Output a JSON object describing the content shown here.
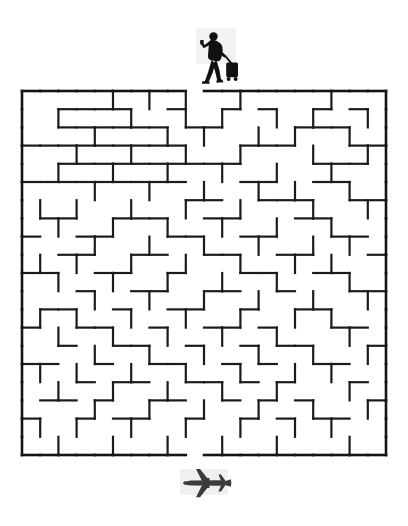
{
  "page": {
    "title": "Travel Maze Puzzle",
    "background_color": "#ffffff",
    "width": 408,
    "height": 526
  },
  "icons": {
    "start": {
      "name": "traveler-with-luggage-icon",
      "label": "Traveler pulling rolling suitcase",
      "color": "#111111",
      "x": 190,
      "y": 28,
      "width": 52,
      "height": 60
    },
    "finish": {
      "name": "airplane-icon",
      "label": "Airplane",
      "color": "#3b3b3b",
      "x": 178,
      "y": 466,
      "width": 58,
      "height": 34
    }
  },
  "maze": {
    "name": "travel-maze",
    "cols": 20,
    "rows": 20,
    "cell_size": 18.2,
    "origin_x": 2,
    "origin_y": 3,
    "wall_color": "#1b1b1b",
    "wall_width": 2.2,
    "border_color": "#141414",
    "border_width": 2.6,
    "entrance": {
      "side": "top",
      "col": 9
    },
    "exit": {
      "side": "bottom",
      "col": 9
    },
    "h_walls": [
      [
        1,
        0,
        1
      ],
      [
        2,
        0,
        1
      ],
      [
        3,
        0,
        1
      ],
      [
        4,
        0,
        1
      ],
      [
        5,
        0,
        1
      ],
      [
        6,
        0,
        1
      ],
      [
        7,
        0,
        1
      ],
      [
        8,
        0,
        1
      ],
      [
        10,
        0,
        1
      ],
      [
        11,
        0,
        1
      ],
      [
        12,
        0,
        1
      ],
      [
        13,
        0,
        1
      ],
      [
        14,
        0,
        1
      ],
      [
        15,
        0,
        1
      ],
      [
        16,
        0,
        1
      ],
      [
        17,
        0,
        1
      ],
      [
        18,
        0,
        1
      ],
      [
        19,
        0,
        1
      ],
      [
        0,
        0,
        1
      ],
      [
        2,
        1,
        1
      ],
      [
        3,
        1,
        1
      ],
      [
        4,
        1,
        1
      ],
      [
        5,
        1,
        1
      ],
      [
        8,
        1,
        1
      ],
      [
        11,
        1,
        1
      ],
      [
        13,
        1,
        1
      ],
      [
        16,
        1,
        1
      ],
      [
        18,
        1,
        1
      ],
      [
        2,
        2,
        1
      ],
      [
        3,
        2,
        1
      ],
      [
        4,
        2,
        1
      ],
      [
        5,
        2,
        1
      ],
      [
        6,
        2,
        1
      ],
      [
        7,
        2,
        1
      ],
      [
        9,
        2,
        1
      ],
      [
        10,
        2,
        1
      ],
      [
        15,
        2,
        1
      ],
      [
        16,
        2,
        1
      ],
      [
        17,
        2,
        1
      ],
      [
        0,
        3,
        1
      ],
      [
        1,
        3,
        1
      ],
      [
        2,
        3,
        1
      ],
      [
        3,
        3,
        1
      ],
      [
        4,
        3,
        1
      ],
      [
        5,
        3,
        1
      ],
      [
        6,
        3,
        1
      ],
      [
        7,
        3,
        1
      ],
      [
        8,
        3,
        1
      ],
      [
        12,
        3,
        1
      ],
      [
        13,
        3,
        1
      ],
      [
        14,
        3,
        1
      ],
      [
        18,
        3,
        1
      ],
      [
        19,
        3,
        1
      ],
      [
        2,
        4,
        1
      ],
      [
        3,
        4,
        1
      ],
      [
        4,
        4,
        1
      ],
      [
        5,
        4,
        1
      ],
      [
        6,
        4,
        1
      ],
      [
        7,
        4,
        1
      ],
      [
        8,
        4,
        1
      ],
      [
        9,
        4,
        1
      ],
      [
        10,
        4,
        1
      ],
      [
        11,
        4,
        1
      ],
      [
        16,
        4,
        1
      ],
      [
        17,
        4,
        1
      ],
      [
        18,
        4,
        1
      ],
      [
        0,
        5,
        1
      ],
      [
        1,
        5,
        1
      ],
      [
        2,
        5,
        1
      ],
      [
        3,
        5,
        1
      ],
      [
        4,
        5,
        1
      ],
      [
        5,
        5,
        1
      ],
      [
        6,
        5,
        1
      ],
      [
        7,
        5,
        1
      ],
      [
        8,
        5,
        1
      ],
      [
        12,
        5,
        1
      ],
      [
        13,
        5,
        1
      ],
      [
        16,
        5,
        1
      ],
      [
        17,
        5,
        1
      ],
      [
        9,
        6,
        1
      ],
      [
        10,
        6,
        1
      ],
      [
        13,
        6,
        1
      ],
      [
        14,
        6,
        1
      ],
      [
        15,
        6,
        1
      ],
      [
        18,
        6,
        1
      ],
      [
        19,
        6,
        1
      ],
      [
        1,
        7,
        1
      ],
      [
        2,
        7,
        1
      ],
      [
        5,
        7,
        1
      ],
      [
        6,
        7,
        1
      ],
      [
        7,
        7,
        1
      ],
      [
        10,
        7,
        1
      ],
      [
        11,
        7,
        1
      ],
      [
        15,
        7,
        1
      ],
      [
        16,
        7,
        1
      ],
      [
        0,
        8,
        1
      ],
      [
        3,
        8,
        1
      ],
      [
        4,
        8,
        1
      ],
      [
        8,
        8,
        1
      ],
      [
        9,
        8,
        1
      ],
      [
        12,
        8,
        1
      ],
      [
        13,
        8,
        1
      ],
      [
        17,
        8,
        1
      ],
      [
        18,
        8,
        1
      ],
      [
        2,
        9,
        1
      ],
      [
        3,
        9,
        1
      ],
      [
        6,
        9,
        1
      ],
      [
        7,
        9,
        1
      ],
      [
        10,
        9,
        1
      ],
      [
        11,
        9,
        1
      ],
      [
        14,
        9,
        1
      ],
      [
        15,
        9,
        1
      ],
      [
        19,
        9,
        1
      ],
      [
        0,
        10,
        1
      ],
      [
        1,
        10,
        1
      ],
      [
        4,
        10,
        1
      ],
      [
        5,
        10,
        1
      ],
      [
        8,
        10,
        1
      ],
      [
        12,
        10,
        1
      ],
      [
        13,
        10,
        1
      ],
      [
        16,
        10,
        1
      ],
      [
        17,
        10,
        1
      ],
      [
        3,
        11,
        1
      ],
      [
        6,
        11,
        1
      ],
      [
        7,
        11,
        1
      ],
      [
        10,
        11,
        1
      ],
      [
        11,
        11,
        1
      ],
      [
        14,
        11,
        1
      ],
      [
        18,
        11,
        1
      ],
      [
        19,
        11,
        1
      ],
      [
        1,
        12,
        1
      ],
      [
        2,
        12,
        1
      ],
      [
        5,
        12,
        1
      ],
      [
        8,
        12,
        1
      ],
      [
        9,
        12,
        1
      ],
      [
        12,
        12,
        1
      ],
      [
        15,
        12,
        1
      ],
      [
        16,
        12,
        1
      ],
      [
        0,
        13,
        1
      ],
      [
        3,
        13,
        1
      ],
      [
        4,
        13,
        1
      ],
      [
        7,
        13,
        1
      ],
      [
        10,
        13,
        1
      ],
      [
        11,
        13,
        1
      ],
      [
        13,
        13,
        1
      ],
      [
        17,
        13,
        1
      ],
      [
        18,
        13,
        1
      ],
      [
        2,
        14,
        1
      ],
      [
        5,
        14,
        1
      ],
      [
        6,
        14,
        1
      ],
      [
        9,
        14,
        1
      ],
      [
        12,
        14,
        1
      ],
      [
        14,
        14,
        1
      ],
      [
        15,
        14,
        1
      ],
      [
        19,
        14,
        1
      ],
      [
        0,
        15,
        1
      ],
      [
        1,
        15,
        1
      ],
      [
        4,
        15,
        1
      ],
      [
        7,
        15,
        1
      ],
      [
        8,
        15,
        1
      ],
      [
        11,
        15,
        1
      ],
      [
        13,
        15,
        1
      ],
      [
        16,
        15,
        1
      ],
      [
        17,
        15,
        1
      ],
      [
        3,
        16,
        1
      ],
      [
        5,
        16,
        1
      ],
      [
        6,
        16,
        1
      ],
      [
        9,
        16,
        1
      ],
      [
        10,
        16,
        1
      ],
      [
        12,
        16,
        1
      ],
      [
        14,
        16,
        1
      ],
      [
        18,
        16,
        1
      ],
      [
        1,
        17,
        1
      ],
      [
        2,
        17,
        1
      ],
      [
        4,
        17,
        1
      ],
      [
        7,
        17,
        1
      ],
      [
        8,
        17,
        1
      ],
      [
        11,
        17,
        1
      ],
      [
        13,
        17,
        1
      ],
      [
        15,
        17,
        1
      ],
      [
        19,
        17,
        1
      ],
      [
        0,
        18,
        1
      ],
      [
        3,
        18,
        1
      ],
      [
        5,
        18,
        1
      ],
      [
        6,
        18,
        1
      ],
      [
        9,
        18,
        1
      ],
      [
        12,
        18,
        1
      ],
      [
        14,
        18,
        1
      ],
      [
        16,
        18,
        1
      ],
      [
        17,
        18,
        1
      ],
      [
        0,
        20,
        1
      ],
      [
        1,
        20,
        1
      ],
      [
        2,
        20,
        1
      ],
      [
        3,
        20,
        1
      ],
      [
        4,
        20,
        1
      ],
      [
        5,
        20,
        1
      ],
      [
        6,
        20,
        1
      ],
      [
        7,
        20,
        1
      ],
      [
        8,
        20,
        1
      ],
      [
        10,
        20,
        1
      ],
      [
        11,
        20,
        1
      ],
      [
        12,
        20,
        1
      ],
      [
        13,
        20,
        1
      ],
      [
        14,
        20,
        1
      ],
      [
        15,
        20,
        1
      ],
      [
        16,
        20,
        1
      ],
      [
        17,
        20,
        1
      ],
      [
        18,
        20,
        1
      ],
      [
        19,
        20,
        1
      ]
    ],
    "v_walls": [
      [
        0,
        0,
        1
      ],
      [
        0,
        1,
        1
      ],
      [
        0,
        2,
        1
      ],
      [
        0,
        3,
        1
      ],
      [
        0,
        4,
        1
      ],
      [
        0,
        5,
        1
      ],
      [
        0,
        6,
        1
      ],
      [
        0,
        7,
        1
      ],
      [
        0,
        8,
        1
      ],
      [
        0,
        9,
        1
      ],
      [
        0,
        10,
        1
      ],
      [
        0,
        11,
        1
      ],
      [
        0,
        12,
        1
      ],
      [
        0,
        13,
        1
      ],
      [
        0,
        14,
        1
      ],
      [
        0,
        15,
        1
      ],
      [
        0,
        16,
        1
      ],
      [
        0,
        17,
        1
      ],
      [
        0,
        18,
        1
      ],
      [
        0,
        19,
        1
      ],
      [
        20,
        0,
        1
      ],
      [
        20,
        1,
        1
      ],
      [
        20,
        2,
        1
      ],
      [
        20,
        3,
        1
      ],
      [
        20,
        4,
        1
      ],
      [
        20,
        5,
        1
      ],
      [
        20,
        6,
        1
      ],
      [
        20,
        7,
        1
      ],
      [
        20,
        8,
        1
      ],
      [
        20,
        9,
        1
      ],
      [
        20,
        10,
        1
      ],
      [
        20,
        11,
        1
      ],
      [
        20,
        12,
        1
      ],
      [
        20,
        13,
        1
      ],
      [
        20,
        14,
        1
      ],
      [
        20,
        15,
        1
      ],
      [
        20,
        16,
        1
      ],
      [
        20,
        17,
        1
      ],
      [
        20,
        18,
        1
      ],
      [
        20,
        19,
        1
      ],
      [
        5,
        0,
        1
      ],
      [
        7,
        0,
        1
      ],
      [
        9,
        0,
        1
      ],
      [
        12,
        0,
        1
      ],
      [
        17,
        0,
        1
      ],
      [
        2,
        1,
        1
      ],
      [
        6,
        1,
        1
      ],
      [
        9,
        1,
        1
      ],
      [
        11,
        1,
        1
      ],
      [
        14,
        1,
        1
      ],
      [
        16,
        1,
        1
      ],
      [
        19,
        1,
        1
      ],
      [
        4,
        2,
        1
      ],
      [
        8,
        2,
        1
      ],
      [
        10,
        2,
        1
      ],
      [
        13,
        2,
        1
      ],
      [
        15,
        2,
        1
      ],
      [
        18,
        2,
        1
      ],
      [
        3,
        3,
        1
      ],
      [
        6,
        3,
        1
      ],
      [
        9,
        3,
        1
      ],
      [
        12,
        3,
        1
      ],
      [
        16,
        3,
        1
      ],
      [
        19,
        3,
        1
      ],
      [
        2,
        4,
        1
      ],
      [
        5,
        4,
        1
      ],
      [
        8,
        4,
        1
      ],
      [
        11,
        4,
        1
      ],
      [
        14,
        4,
        1
      ],
      [
        17,
        4,
        1
      ],
      [
        4,
        5,
        1
      ],
      [
        7,
        5,
        1
      ],
      [
        10,
        5,
        1
      ],
      [
        13,
        5,
        1
      ],
      [
        15,
        5,
        1
      ],
      [
        18,
        5,
        1
      ],
      [
        1,
        6,
        1
      ],
      [
        3,
        6,
        1
      ],
      [
        6,
        6,
        1
      ],
      [
        9,
        6,
        1
      ],
      [
        12,
        6,
        1
      ],
      [
        16,
        6,
        1
      ],
      [
        19,
        6,
        1
      ],
      [
        2,
        7,
        1
      ],
      [
        5,
        7,
        1
      ],
      [
        8,
        7,
        1
      ],
      [
        11,
        7,
        1
      ],
      [
        14,
        7,
        1
      ],
      [
        17,
        7,
        1
      ],
      [
        4,
        8,
        1
      ],
      [
        7,
        8,
        1
      ],
      [
        10,
        8,
        1
      ],
      [
        13,
        8,
        1
      ],
      [
        16,
        8,
        1
      ],
      [
        18,
        8,
        1
      ],
      [
        1,
        9,
        1
      ],
      [
        3,
        9,
        1
      ],
      [
        6,
        9,
        1
      ],
      [
        9,
        9,
        1
      ],
      [
        12,
        9,
        1
      ],
      [
        15,
        9,
        1
      ],
      [
        17,
        9,
        1
      ],
      [
        2,
        10,
        1
      ],
      [
        5,
        10,
        1
      ],
      [
        8,
        10,
        1
      ],
      [
        11,
        10,
        1
      ],
      [
        14,
        10,
        1
      ],
      [
        18,
        10,
        1
      ],
      [
        4,
        11,
        1
      ],
      [
        7,
        11,
        1
      ],
      [
        10,
        11,
        1
      ],
      [
        13,
        11,
        1
      ],
      [
        16,
        11,
        1
      ],
      [
        19,
        11,
        1
      ],
      [
        1,
        12,
        1
      ],
      [
        3,
        12,
        1
      ],
      [
        6,
        12,
        1
      ],
      [
        9,
        12,
        1
      ],
      [
        12,
        12,
        1
      ],
      [
        15,
        12,
        1
      ],
      [
        17,
        12,
        1
      ],
      [
        2,
        13,
        1
      ],
      [
        5,
        13,
        1
      ],
      [
        8,
        13,
        1
      ],
      [
        11,
        13,
        1
      ],
      [
        14,
        13,
        1
      ],
      [
        18,
        13,
        1
      ],
      [
        4,
        14,
        1
      ],
      [
        7,
        14,
        1
      ],
      [
        10,
        14,
        1
      ],
      [
        13,
        14,
        1
      ],
      [
        16,
        14,
        1
      ],
      [
        19,
        14,
        1
      ],
      [
        1,
        15,
        1
      ],
      [
        3,
        15,
        1
      ],
      [
        6,
        15,
        1
      ],
      [
        9,
        15,
        1
      ],
      [
        12,
        15,
        1
      ],
      [
        15,
        15,
        1
      ],
      [
        17,
        15,
        1
      ],
      [
        2,
        16,
        1
      ],
      [
        5,
        16,
        1
      ],
      [
        8,
        16,
        1
      ],
      [
        11,
        16,
        1
      ],
      [
        14,
        16,
        1
      ],
      [
        18,
        16,
        1
      ],
      [
        4,
        17,
        1
      ],
      [
        7,
        17,
        1
      ],
      [
        10,
        17,
        1
      ],
      [
        13,
        17,
        1
      ],
      [
        16,
        17,
        1
      ],
      [
        19,
        17,
        1
      ],
      [
        1,
        18,
        1
      ],
      [
        3,
        18,
        1
      ],
      [
        6,
        18,
        1
      ],
      [
        9,
        18,
        1
      ],
      [
        12,
        18,
        1
      ],
      [
        15,
        18,
        1
      ],
      [
        17,
        18,
        1
      ],
      [
        2,
        19,
        1
      ],
      [
        5,
        19,
        1
      ],
      [
        8,
        19,
        1
      ],
      [
        11,
        19,
        1
      ],
      [
        14,
        19,
        1
      ],
      [
        18,
        19,
        1
      ]
    ]
  }
}
